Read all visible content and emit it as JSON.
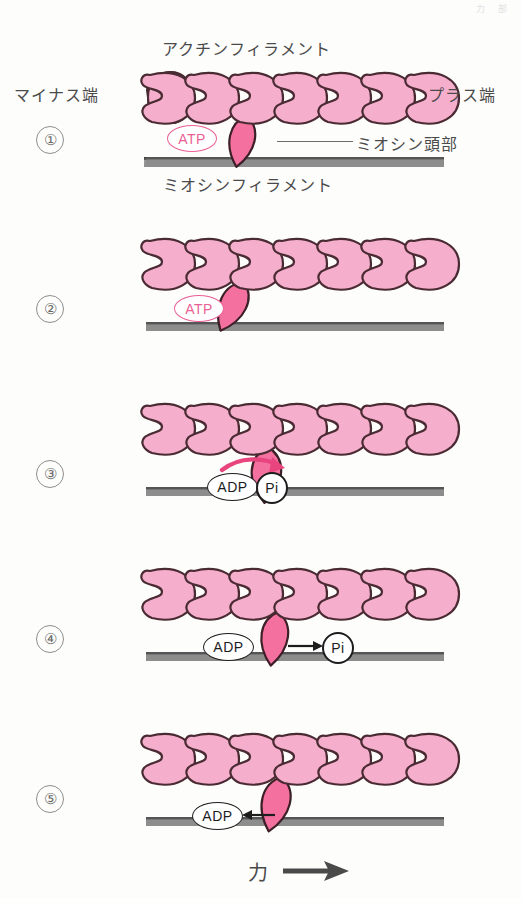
{
  "figure": {
    "title_actin": "アクチンフィラメント",
    "title_myosin": "ミオシンフィラメント",
    "label_minus_end": "マイナス端",
    "label_plus_end": "プラス端",
    "label_myosin_head": "ミオシン頭部",
    "label_force": "力",
    "corner_faint": "力 部"
  },
  "colors": {
    "actin_fill": "#f5aecb",
    "actin_stroke": "#4a2b33",
    "myosin_head_fill": "#f4709f",
    "myosin_head_stroke": "#3d2027",
    "filament_grey": "#8d8d8d",
    "filament_dark": "#555555",
    "atp_pink": "#ea5f95",
    "arrow_pink": "#e8457f",
    "text_grey": "#4a4a4a",
    "number_grey": "#6b6b6b"
  },
  "steps": [
    {
      "number": "①",
      "badges": [
        {
          "kind": "atp",
          "text": "ATP"
        }
      ],
      "head_state": "attached-upright",
      "arrows": []
    },
    {
      "number": "②",
      "badges": [
        {
          "kind": "atp",
          "text": "ATP"
        }
      ],
      "head_state": "detached-tilted-right",
      "arrows": []
    },
    {
      "number": "③",
      "badges": [
        {
          "kind": "adp",
          "text": "ADP"
        },
        {
          "kind": "pi",
          "text": "Pi"
        }
      ],
      "head_state": "cocked-curved",
      "arrows": [
        {
          "kind": "curved-pink",
          "direction": "right"
        }
      ]
    },
    {
      "number": "④",
      "badges": [
        {
          "kind": "adp",
          "text": "ADP"
        },
        {
          "kind": "pi",
          "text": "Pi"
        }
      ],
      "head_state": "attached-upright",
      "arrows": [
        {
          "kind": "straight-black",
          "direction": "right"
        }
      ]
    },
    {
      "number": "⑤",
      "badges": [
        {
          "kind": "adp",
          "text": "ADP"
        }
      ],
      "head_state": "power-stroke-tilted",
      "arrows": [
        {
          "kind": "straight-black",
          "direction": "left"
        },
        {
          "kind": "thick-grey",
          "direction": "right"
        }
      ]
    }
  ],
  "actin_monomer_count": 7
}
